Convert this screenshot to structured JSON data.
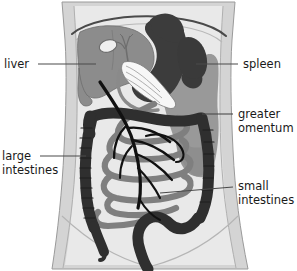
{
  "figure": {
    "type": "anatomical-diagram",
    "background_color": "#ffffff"
  },
  "labels": {
    "liver": "liver",
    "large_intestines_line1": "large",
    "large_intestines_line2": "intestines",
    "spleen": "spleen",
    "greater_omentum_line1": "greater",
    "greater_omentum_line2": "omentum",
    "small_intestines_line1": "small",
    "small_intestines_line2": "intestines"
  },
  "colors": {
    "background": "#ffffff",
    "torso_band": "#d4d4d4",
    "torso_interior": "#e9e9e9",
    "outline": "#6e6e6e",
    "diaphragm_line": "#4a4a4a",
    "liver": "#8c8c8c",
    "stomach": "#3c3c3c",
    "greater_omentum": "#919191",
    "large_intestine": "#2f2f2f",
    "small_intestine": "#7f7f7f",
    "gallbladder": "#f2f2f2",
    "pancreas_stripes": "#fafafa",
    "vessels": "#111111",
    "label_text": "#1a1a1a",
    "leader_line": "#4a4a4a"
  },
  "structures": [
    {
      "name": "liver",
      "shade": "medium-gray",
      "position": "upper-left"
    },
    {
      "name": "stomach",
      "shade": "dark-gray",
      "position": "upper-right"
    },
    {
      "name": "spleen",
      "shade": "dark-gray",
      "position": "upper-right-lateral"
    },
    {
      "name": "gallbladder",
      "shade": "white",
      "position": "upper-center"
    },
    {
      "name": "pancreas-duodenum",
      "shade": "white-striped",
      "position": "center-upper"
    },
    {
      "name": "greater-omentum",
      "shade": "medium-gray",
      "position": "right"
    },
    {
      "name": "large-intestine",
      "shade": "near-black",
      "position": "perimeter"
    },
    {
      "name": "small-intestine",
      "shade": "medium-gray",
      "position": "center"
    },
    {
      "name": "mesenteric-vessels",
      "shade": "black",
      "position": "center"
    }
  ],
  "leaders": [
    {
      "name": "liver-leader",
      "from": [
        38,
        64
      ],
      "to": [
        96,
        64
      ]
    },
    {
      "name": "large-intestines-leader",
      "from": [
        40,
        156
      ],
      "to": [
        86,
        156
      ]
    },
    {
      "name": "spleen-leader",
      "from": [
        238,
        64
      ],
      "to": [
        196,
        64
      ]
    },
    {
      "name": "greater-omentum-leader",
      "from": [
        233,
        114
      ],
      "to": [
        202,
        114
      ]
    },
    {
      "name": "small-intestines-leader",
      "from": [
        233,
        187
      ],
      "to": [
        160,
        193
      ]
    }
  ]
}
